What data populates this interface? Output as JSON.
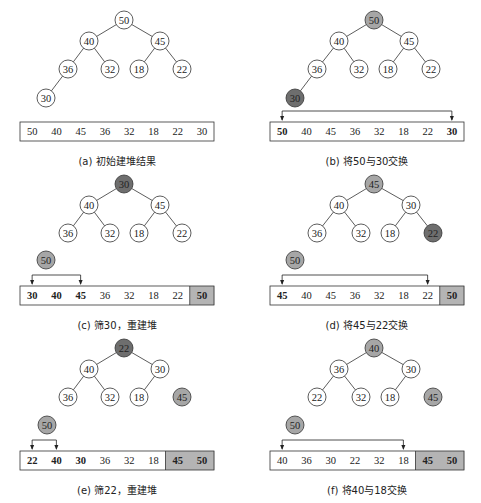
{
  "colors": {
    "stroke": "#333333",
    "node_fill": "#ffffff",
    "highlight_light": "#a6a6a6",
    "highlight_dark": "#6e6e6e",
    "sorted_cell": "#b4b4b4",
    "sorted_cell_dark": "#9a9a9a"
  },
  "panels": [
    {
      "id": "a",
      "caption": "(a) 初始建堆结果",
      "origin": [
        0,
        0
      ],
      "nodes": [
        {
          "v": "50",
          "x": 124,
          "y": 20,
          "fill": "none"
        },
        {
          "v": "40",
          "x": 89,
          "y": 41,
          "fill": "none"
        },
        {
          "v": "45",
          "x": 160,
          "y": 41,
          "fill": "none"
        },
        {
          "v": "36",
          "x": 68,
          "y": 69,
          "fill": "none"
        },
        {
          "v": "32",
          "x": 110,
          "y": 69,
          "fill": "none"
        },
        {
          "v": "18",
          "x": 139,
          "y": 69,
          "fill": "none"
        },
        {
          "v": "22",
          "x": 182,
          "y": 69,
          "fill": "none"
        },
        {
          "v": "30",
          "x": 46,
          "y": 98,
          "fill": "none"
        }
      ],
      "edges": [
        [
          0,
          1
        ],
        [
          0,
          2
        ],
        [
          1,
          3
        ],
        [
          1,
          4
        ],
        [
          2,
          5
        ],
        [
          2,
          6
        ],
        [
          3,
          7
        ]
      ],
      "floating": [],
      "array": {
        "y": 122,
        "x": 20,
        "cell_w": 24.25,
        "h": 19,
        "cells": [
          {
            "v": "50",
            "bold": false,
            "sorted": false
          },
          {
            "v": "40",
            "bold": false,
            "sorted": false
          },
          {
            "v": "45",
            "bold": false,
            "sorted": false
          },
          {
            "v": "36",
            "bold": false,
            "sorted": false
          },
          {
            "v": "32",
            "bold": false,
            "sorted": false
          },
          {
            "v": "18",
            "bold": false,
            "sorted": false
          },
          {
            "v": "22",
            "bold": false,
            "sorted": false
          },
          {
            "v": "30",
            "bold": false,
            "sorted": false
          }
        ]
      },
      "swap_arrow": null,
      "caption_y": 165
    },
    {
      "id": "b",
      "caption": "(b) 将50与30交换",
      "origin": [
        0,
        0
      ],
      "nodes": [
        {
          "v": "50",
          "x": 374,
          "y": 20,
          "fill": "light"
        },
        {
          "v": "40",
          "x": 339,
          "y": 41,
          "fill": "none"
        },
        {
          "v": "45",
          "x": 409,
          "y": 41,
          "fill": "none"
        },
        {
          "v": "36",
          "x": 317,
          "y": 69,
          "fill": "none"
        },
        {
          "v": "32",
          "x": 359,
          "y": 69,
          "fill": "none"
        },
        {
          "v": "18",
          "x": 388,
          "y": 69,
          "fill": "none"
        },
        {
          "v": "22",
          "x": 431,
          "y": 69,
          "fill": "none"
        },
        {
          "v": "30",
          "x": 295,
          "y": 98,
          "fill": "dark"
        }
      ],
      "edges": [
        [
          0,
          1
        ],
        [
          0,
          2
        ],
        [
          1,
          3
        ],
        [
          1,
          4
        ],
        [
          2,
          5
        ],
        [
          2,
          6
        ],
        [
          3,
          7
        ]
      ],
      "floating": [],
      "array": {
        "y": 122,
        "x": 270,
        "cell_w": 24.25,
        "h": 19,
        "cells": [
          {
            "v": "50",
            "bold": true,
            "sorted": false
          },
          {
            "v": "40",
            "bold": false,
            "sorted": false
          },
          {
            "v": "45",
            "bold": false,
            "sorted": false
          },
          {
            "v": "36",
            "bold": false,
            "sorted": false
          },
          {
            "v": "32",
            "bold": false,
            "sorted": false
          },
          {
            "v": "18",
            "bold": false,
            "sorted": false
          },
          {
            "v": "22",
            "bold": false,
            "sorted": false
          },
          {
            "v": "30",
            "bold": true,
            "sorted": false
          }
        ]
      },
      "swap_arrow": {
        "from": 0,
        "to": 7,
        "y": 111
      },
      "caption_y": 165
    },
    {
      "id": "c",
      "caption": "(c) 筛30，重建堆",
      "nodes": [
        {
          "v": "30",
          "x": 124,
          "y": 184,
          "fill": "dark"
        },
        {
          "v": "40",
          "x": 89,
          "y": 205,
          "fill": "none"
        },
        {
          "v": "45",
          "x": 160,
          "y": 205,
          "fill": "none"
        },
        {
          "v": "36",
          "x": 68,
          "y": 233,
          "fill": "none"
        },
        {
          "v": "32",
          "x": 110,
          "y": 233,
          "fill": "none"
        },
        {
          "v": "18",
          "x": 139,
          "y": 233,
          "fill": "none"
        },
        {
          "v": "22",
          "x": 182,
          "y": 233,
          "fill": "none"
        }
      ],
      "edges": [
        [
          0,
          1
        ],
        [
          0,
          2
        ],
        [
          1,
          3
        ],
        [
          1,
          4
        ],
        [
          2,
          5
        ],
        [
          2,
          6
        ]
      ],
      "floating": [
        {
          "v": "50",
          "x": 46,
          "y": 260,
          "fill": "light"
        }
      ],
      "array": {
        "y": 286,
        "x": 20,
        "cell_w": 24.25,
        "h": 19,
        "cells": [
          {
            "v": "30",
            "bold": true,
            "sorted": false
          },
          {
            "v": "40",
            "bold": true,
            "sorted": false
          },
          {
            "v": "45",
            "bold": true,
            "sorted": false
          },
          {
            "v": "36",
            "bold": false,
            "sorted": false
          },
          {
            "v": "32",
            "bold": false,
            "sorted": false
          },
          {
            "v": "18",
            "bold": false,
            "sorted": false
          },
          {
            "v": "22",
            "bold": false,
            "sorted": false
          },
          {
            "v": "50",
            "bold": true,
            "sorted": true
          }
        ]
      },
      "swap_arrow": {
        "from": 0,
        "to": 2,
        "y": 275
      },
      "caption_y": 329
    },
    {
      "id": "d",
      "caption": "(d) 将45与22交换",
      "nodes": [
        {
          "v": "45",
          "x": 374,
          "y": 184,
          "fill": "light"
        },
        {
          "v": "40",
          "x": 339,
          "y": 205,
          "fill": "none"
        },
        {
          "v": "30",
          "x": 411,
          "y": 205,
          "fill": "none"
        },
        {
          "v": "36",
          "x": 317,
          "y": 233,
          "fill": "none"
        },
        {
          "v": "32",
          "x": 361,
          "y": 233,
          "fill": "none"
        },
        {
          "v": "18",
          "x": 390,
          "y": 233,
          "fill": "none"
        },
        {
          "v": "22",
          "x": 433,
          "y": 233,
          "fill": "dark"
        }
      ],
      "edges": [
        [
          0,
          1
        ],
        [
          0,
          2
        ],
        [
          1,
          3
        ],
        [
          1,
          4
        ],
        [
          2,
          5
        ],
        [
          2,
          6
        ]
      ],
      "floating": [
        {
          "v": "50",
          "x": 295,
          "y": 260,
          "fill": "light"
        }
      ],
      "array": {
        "y": 286,
        "x": 270,
        "cell_w": 24.25,
        "h": 19,
        "cells": [
          {
            "v": "45",
            "bold": true,
            "sorted": false
          },
          {
            "v": "40",
            "bold": false,
            "sorted": false
          },
          {
            "v": "45",
            "bold": false,
            "sorted": false
          },
          {
            "v": "36",
            "bold": false,
            "sorted": false
          },
          {
            "v": "32",
            "bold": false,
            "sorted": false
          },
          {
            "v": "18",
            "bold": false,
            "sorted": false
          },
          {
            "v": "22",
            "bold": false,
            "sorted": false
          },
          {
            "v": "50",
            "bold": true,
            "sorted": true
          }
        ]
      },
      "swap_arrow": {
        "from": 0,
        "to": 6,
        "y": 275
      },
      "caption_y": 329
    },
    {
      "id": "e",
      "caption": "(e) 筛22，重建堆",
      "nodes": [
        {
          "v": "22",
          "x": 124,
          "y": 348,
          "fill": "dark"
        },
        {
          "v": "40",
          "x": 89,
          "y": 369,
          "fill": "none"
        },
        {
          "v": "30",
          "x": 160,
          "y": 369,
          "fill": "none"
        },
        {
          "v": "36",
          "x": 68,
          "y": 397,
          "fill": "none"
        },
        {
          "v": "32",
          "x": 110,
          "y": 397,
          "fill": "none"
        },
        {
          "v": "18",
          "x": 139,
          "y": 397,
          "fill": "none"
        }
      ],
      "edges": [
        [
          0,
          1
        ],
        [
          0,
          2
        ],
        [
          1,
          3
        ],
        [
          1,
          4
        ],
        [
          2,
          5
        ]
      ],
      "floating": [
        {
          "v": "45",
          "x": 182,
          "y": 397,
          "fill": "light"
        },
        {
          "v": "50",
          "x": 47,
          "y": 425,
          "fill": "light"
        }
      ],
      "array": {
        "y": 451,
        "x": 20,
        "cell_w": 24.25,
        "h": 19,
        "cells": [
          {
            "v": "22",
            "bold": true,
            "sorted": false
          },
          {
            "v": "40",
            "bold": true,
            "sorted": false
          },
          {
            "v": "30",
            "bold": true,
            "sorted": false
          },
          {
            "v": "36",
            "bold": false,
            "sorted": false
          },
          {
            "v": "32",
            "bold": false,
            "sorted": false
          },
          {
            "v": "18",
            "bold": false,
            "sorted": false
          },
          {
            "v": "45",
            "bold": true,
            "sorted": true
          },
          {
            "v": "50",
            "bold": true,
            "sorted": true
          }
        ]
      },
      "swap_arrow": {
        "from": 0,
        "to": 1,
        "y": 440
      },
      "caption_y": 494
    },
    {
      "id": "f",
      "caption": "(f) 将40与18交换",
      "nodes": [
        {
          "v": "40",
          "x": 374,
          "y": 348,
          "fill": "light"
        },
        {
          "v": "36",
          "x": 339,
          "y": 369,
          "fill": "none"
        },
        {
          "v": "30",
          "x": 411,
          "y": 369,
          "fill": "none"
        },
        {
          "v": "22",
          "x": 317,
          "y": 397,
          "fill": "none"
        },
        {
          "v": "32",
          "x": 361,
          "y": 397,
          "fill": "none"
        },
        {
          "v": "18",
          "x": 390,
          "y": 397,
          "fill": "none"
        }
      ],
      "edges": [
        [
          0,
          1
        ],
        [
          0,
          2
        ],
        [
          1,
          3
        ],
        [
          1,
          4
        ],
        [
          2,
          5
        ]
      ],
      "floating": [
        {
          "v": "45",
          "x": 433,
          "y": 397,
          "fill": "light"
        },
        {
          "v": "50",
          "x": 295,
          "y": 425,
          "fill": "light"
        }
      ],
      "array": {
        "y": 451,
        "x": 270,
        "cell_w": 24.25,
        "h": 19,
        "cells": [
          {
            "v": "40",
            "bold": false,
            "sorted": false
          },
          {
            "v": "36",
            "bold": false,
            "sorted": false
          },
          {
            "v": "30",
            "bold": false,
            "sorted": false
          },
          {
            "v": "22",
            "bold": false,
            "sorted": false
          },
          {
            "v": "32",
            "bold": false,
            "sorted": false
          },
          {
            "v": "18",
            "bold": false,
            "sorted": false
          },
          {
            "v": "45",
            "bold": true,
            "sorted": true
          },
          {
            "v": "50",
            "bold": true,
            "sorted": true
          }
        ]
      },
      "swap_arrow": {
        "from": 0,
        "to": 5,
        "y": 440
      },
      "caption_y": 494
    }
  ]
}
